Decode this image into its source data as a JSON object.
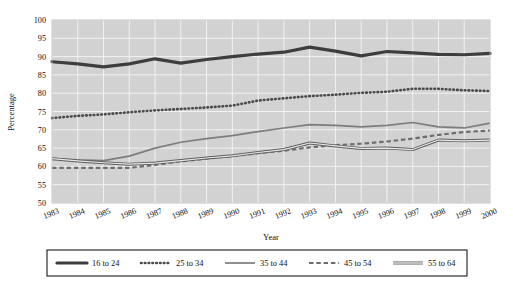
{
  "chart_data": {
    "type": "line",
    "title": "",
    "xlabel": "Year",
    "ylabel": "Percentage",
    "grid": true,
    "legend_position": "bottom",
    "xlim": [
      1983,
      2000
    ],
    "ylim": [
      50,
      100
    ],
    "ytick_step": 5,
    "yticks": [
      50,
      55,
      60,
      65,
      70,
      75,
      80,
      85,
      90,
      95,
      100
    ],
    "categories": [
      "1983",
      "1984",
      "1985",
      "1986",
      "1987",
      "1988",
      "1989",
      "1990",
      "1991",
      "1992",
      "1993",
      "1994",
      "1995",
      "1996",
      "1997",
      "1998",
      "1999",
      "2000"
    ],
    "series": [
      {
        "name": "16 to 24",
        "style": "thick-solid",
        "color": "#3d3d3d",
        "values": [
          88.6,
          88.0,
          87.2,
          88.0,
          89.4,
          88.2,
          89.2,
          90.0,
          90.7,
          91.2,
          92.6,
          91.5,
          90.2,
          91.4,
          91.0,
          90.6,
          90.5,
          90.9
        ]
      },
      {
        "name": "25 to 34",
        "style": "dotted",
        "color": "#4a4a4a",
        "values": [
          73.2,
          73.8,
          74.2,
          74.8,
          75.3,
          75.7,
          76.1,
          76.6,
          78.0,
          78.6,
          79.2,
          79.6,
          80.1,
          80.4,
          81.2,
          81.2,
          80.8,
          80.6
        ]
      },
      {
        "name": "35 to 44",
        "style": "medium-solid",
        "color": "#7d7d7d",
        "values": [
          62.2,
          61.8,
          61.6,
          62.8,
          65.0,
          66.6,
          67.6,
          68.4,
          69.5,
          70.5,
          71.4,
          71.2,
          70.8,
          71.2,
          72.0,
          70.8,
          70.5,
          71.8
        ]
      },
      {
        "name": "45 to 54",
        "style": "dashed",
        "color": "#6e6e6e",
        "values": [
          59.6,
          59.6,
          59.6,
          59.6,
          60.4,
          61.4,
          62.1,
          62.8,
          63.6,
          64.3,
          65.2,
          65.8,
          66.2,
          66.8,
          67.6,
          68.6,
          69.4,
          69.8
        ]
      },
      {
        "name": "55 to 64",
        "style": "thin-double",
        "color": "#5e5e5e",
        "values": [
          62.1,
          61.5,
          61.0,
          60.6,
          60.9,
          61.6,
          62.3,
          62.9,
          63.8,
          64.6,
          66.4,
          65.6,
          64.9,
          65.0,
          64.6,
          67.2,
          67.0,
          67.2
        ]
      }
    ]
  },
  "axes": {
    "y_title": "Percentage",
    "x_title": "Year"
  },
  "legend": {
    "items": [
      {
        "label": "16 to 24",
        "swatch": "thick-solid-swatch"
      },
      {
        "label": "25 to 34",
        "swatch": "dotted-swatch"
      },
      {
        "label": "35 to 44",
        "swatch": "medium-solid-swatch"
      },
      {
        "label": "45 to 54",
        "swatch": "dashed-swatch"
      },
      {
        "label": "55 to 64",
        "swatch": "thin-double-swatch"
      }
    ]
  },
  "yticks": [
    {
      "label": "100"
    },
    {
      "label": "95"
    },
    {
      "label": "90"
    },
    {
      "label": "85"
    },
    {
      "label": "80"
    },
    {
      "label": "75"
    },
    {
      "label": "70"
    },
    {
      "label": "65"
    },
    {
      "label": "60"
    },
    {
      "label": "55"
    },
    {
      "label": "50"
    }
  ]
}
